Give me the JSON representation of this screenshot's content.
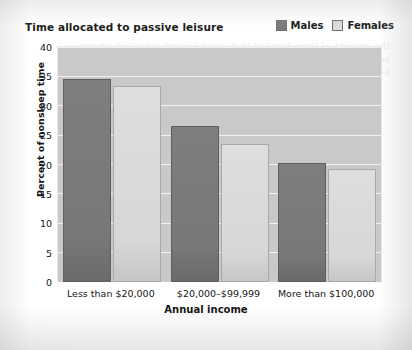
{
  "chart_data": {
    "type": "bar",
    "title": "Time allocated to passive leisure",
    "xlabel": "Annual income",
    "ylabel": "Percent of nonsleep time",
    "categories": [
      "Less than $20,000",
      "$20,000–$99,999",
      "More than $100,000"
    ],
    "series": [
      {
        "name": "Males",
        "color": "#7b7b7b",
        "values": [
          34.5,
          26.5,
          20.3
        ]
      },
      {
        "name": "Females",
        "color": "#dcdcdc",
        "values": [
          33.3,
          23.5,
          19.2
        ]
      }
    ],
    "ylim": [
      0,
      40
    ],
    "yticks": [
      0,
      5,
      10,
      15,
      20,
      25,
      30,
      35,
      40
    ],
    "ytick_labels": [
      "0",
      "5",
      "10",
      "15",
      "20",
      "25",
      "30",
      "35",
      "40"
    ],
    "grid": true,
    "legend_position": "top-right",
    "plot_background": "#c9c9c9",
    "gridline_color": "#f2f2f2"
  },
  "bleed_text": "the amount of time devoted to passive leisure activities among adults declined steadily as annual household income increased for both men and women in the survey sample"
}
